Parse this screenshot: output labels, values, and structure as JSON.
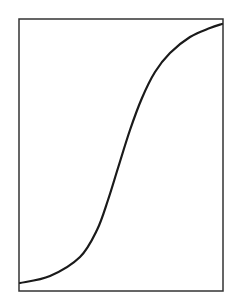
{
  "chart_data": {
    "type": "line",
    "title": "",
    "xlabel": "",
    "ylabel": "",
    "grid": false,
    "legend": null,
    "frame": {
      "left": 19,
      "top": 19,
      "right": 223,
      "bottom": 291
    },
    "series": [
      {
        "name": "sigmoid-curve",
        "color": "#1a1a1a",
        "points_px": [
          [
            20,
            283
          ],
          [
            50,
            276
          ],
          [
            80,
            257
          ],
          [
            97,
            230
          ],
          [
            108,
            200
          ],
          [
            118,
            168
          ],
          [
            130,
            130
          ],
          [
            142,
            98
          ],
          [
            155,
            72
          ],
          [
            170,
            53
          ],
          [
            190,
            37
          ],
          [
            210,
            28
          ],
          [
            222,
            24
          ]
        ]
      }
    ]
  }
}
